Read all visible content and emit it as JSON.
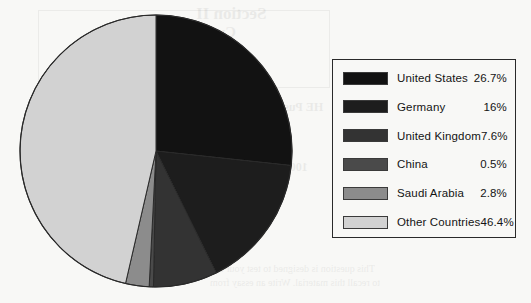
{
  "background_color": "#f8f8f6",
  "ghost_texts": [
    {
      "text": "Section II",
      "x": 196,
      "y": 4,
      "size": 17,
      "weight": "bold"
    },
    {
      "text": "Current Base",
      "x": 150,
      "y": 24,
      "size": 15,
      "weight": "bold"
    },
    {
      "text": "tion",
      "x": 120,
      "y": 30,
      "size": 15,
      "weight": "bold"
    },
    {
      "text": "HE Pushing Forced - Number",
      "x": 170,
      "y": 100,
      "size": 12,
      "weight": "bold"
    },
    {
      "text": "1,500 Countries",
      "x": 200,
      "y": 122,
      "size": 12,
      "weight": "bold"
    },
    {
      "text": "100 for 3 Count Form",
      "x": 196,
      "y": 160,
      "size": 12,
      "weight": "bold"
    },
    {
      "text": "This question is designed to test your ability",
      "x": 198,
      "y": 263,
      "size": 10,
      "weight": "normal"
    },
    {
      "text": "to recall this material. Write an essay from",
      "x": 210,
      "y": 277,
      "size": 10,
      "weight": "normal"
    }
  ],
  "chart_data": {
    "type": "pie",
    "title": "",
    "start_angle_deg": 0,
    "direction": "clockwise",
    "legend_position": "right",
    "categories": [
      "United States",
      "Germany",
      "United Kingdom",
      "China",
      "Saudi Arabia",
      "Other Countries"
    ],
    "values": [
      26.7,
      16,
      7.6,
      0.5,
      2.8,
      46.4
    ],
    "value_labels": [
      "26.7%",
      "16%",
      "7.6%",
      "0.5%",
      "2.8%",
      "46.4%"
    ],
    "colors": [
      "#121212",
      "#1d1d1d",
      "#333333",
      "#4a4a4a",
      "#8c8c8c",
      "#d2d2d2"
    ],
    "slice_border_color": "#2a2a2a",
    "units": "percent"
  },
  "legend": {
    "rows": [
      {
        "label": "United States",
        "value": "26.7%",
        "color": "#121212",
        "swatch_name": "legend-swatch-united-states"
      },
      {
        "label": "Germany",
        "value": "16%",
        "color": "#1d1d1d",
        "swatch_name": "legend-swatch-germany"
      },
      {
        "label": "United Kingdom",
        "value": "7.6%",
        "color": "#333333",
        "swatch_name": "legend-swatch-united-kingdom"
      },
      {
        "label": "China",
        "value": "0.5%",
        "color": "#4a4a4a",
        "swatch_name": "legend-swatch-china"
      },
      {
        "label": "Saudi Arabia",
        "value": "2.8%",
        "color": "#8c8c8c",
        "swatch_name": "legend-swatch-saudi-arabia"
      },
      {
        "label": "Other Countries",
        "value": "46.4%",
        "color": "#d2d2d2",
        "swatch_name": "legend-swatch-other-countries"
      }
    ]
  }
}
